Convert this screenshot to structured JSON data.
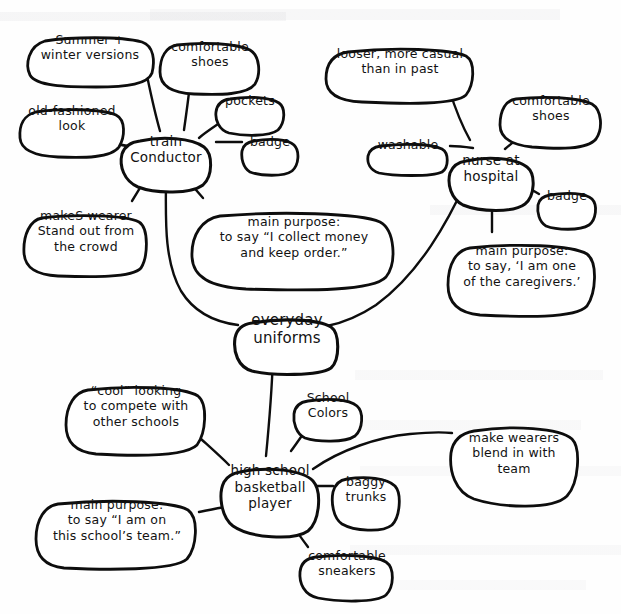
{
  "diagram": {
    "title": "everyday uniforms",
    "type": "concept-map",
    "style": "hand-drawn pencil on white paper",
    "ink_color": "#0d0d0d",
    "paper_color": "#fefefe"
  },
  "hub": {
    "id": "everyday-uniforms",
    "label": "everyday\nuniforms"
  },
  "branches": [
    {
      "id": "train-conductor",
      "label": "train\nConductor",
      "attributes": [
        {
          "id": "summer-winter-versions",
          "label": "Summer +\nwinter versions"
        },
        {
          "id": "old-fashioned-look",
          "label": "old-fashioned\nlook"
        },
        {
          "id": "comfortable-shoes-conductor",
          "label": "comfortable\nshoes"
        },
        {
          "id": "pockets",
          "label": "pockets"
        },
        {
          "id": "badge-conductor",
          "label": "badge"
        },
        {
          "id": "makes-wearer-stand-out",
          "label": "makeS wearer\nStand out from\nthe crowd"
        },
        {
          "id": "main-purpose-conductor",
          "label": "main purpose:\nto say “I collect money\nand keep order.”"
        }
      ]
    },
    {
      "id": "nurse-at-hospital",
      "label": "nurse at\nhospital",
      "attributes": [
        {
          "id": "looser-more-casual",
          "label": "looser, more casual\nthan in past"
        },
        {
          "id": "washable",
          "label": "washable"
        },
        {
          "id": "comfortable-shoes-nurse",
          "label": "comfortable\nshoes"
        },
        {
          "id": "badge-nurse",
          "label": "badge"
        },
        {
          "id": "main-purpose-nurse",
          "label": "main purpose:\nto say, ‘I am one\nof the caregivers.’"
        }
      ]
    },
    {
      "id": "high-school-basketball-player",
      "label": "high school\nbasketball\nplayer",
      "attributes": [
        {
          "id": "cool-looking",
          "label": "“cool” looking\nto compete with\nother schools"
        },
        {
          "id": "school-colors",
          "label": "School\nColors"
        },
        {
          "id": "baggy-trunks",
          "label": "baggy\ntrunks"
        },
        {
          "id": "make-wearers-blend-in",
          "label": "make wearers\nblend in with\nteam"
        },
        {
          "id": "comfortable-sneakers",
          "label": "comfortable\nsneakers"
        },
        {
          "id": "main-purpose-player",
          "label": "main purpose:\nto say “I am on\nthis school’s team.”"
        }
      ]
    }
  ],
  "edges": [
    {
      "from": "summer-winter-versions",
      "to": "train-conductor"
    },
    {
      "from": "old-fashioned-look",
      "to": "train-conductor"
    },
    {
      "from": "comfortable-shoes-conductor",
      "to": "train-conductor"
    },
    {
      "from": "pockets",
      "to": "train-conductor"
    },
    {
      "from": "badge-conductor",
      "to": "train-conductor"
    },
    {
      "from": "makes-wearer-stand-out",
      "to": "train-conductor"
    },
    {
      "from": "main-purpose-conductor",
      "to": "train-conductor"
    },
    {
      "from": "train-conductor",
      "to": "everyday-uniforms"
    },
    {
      "from": "looser-more-casual",
      "to": "nurse-at-hospital"
    },
    {
      "from": "washable",
      "to": "nurse-at-hospital"
    },
    {
      "from": "comfortable-shoes-nurse",
      "to": "nurse-at-hospital"
    },
    {
      "from": "badge-nurse",
      "to": "nurse-at-hospital"
    },
    {
      "from": "main-purpose-nurse",
      "to": "nurse-at-hospital"
    },
    {
      "from": "nurse-at-hospital",
      "to": "everyday-uniforms"
    },
    {
      "from": "everyday-uniforms",
      "to": "high-school-basketball-player"
    },
    {
      "from": "cool-looking",
      "to": "high-school-basketball-player"
    },
    {
      "from": "school-colors",
      "to": "high-school-basketball-player"
    },
    {
      "from": "baggy-trunks",
      "to": "high-school-basketball-player"
    },
    {
      "from": "make-wearers-blend-in",
      "to": "high-school-basketball-player"
    },
    {
      "from": "comfortable-sneakers",
      "to": "high-school-basketball-player"
    },
    {
      "from": "main-purpose-player",
      "to": "high-school-basketball-player"
    }
  ]
}
